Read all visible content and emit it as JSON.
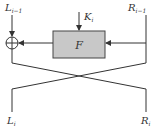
{
  "diagram": {
    "type": "feistel-round",
    "inputs": {
      "left": "L",
      "left_sub": "i−1",
      "right": "R",
      "right_sub": "i−1"
    },
    "key": {
      "label": "K",
      "sub": "i"
    },
    "function": {
      "label": "F",
      "fill": "#c8c8c8"
    },
    "outputs": {
      "left": "L",
      "left_sub": "i",
      "right": "R",
      "right_sub": "i"
    },
    "colors": {
      "line": "#333333",
      "box_fill": "#c8c8c8",
      "box_stroke": "#444444"
    }
  }
}
